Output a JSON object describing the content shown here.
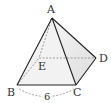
{
  "diagram": {
    "type": "square-based pyramid",
    "vertices": {
      "A": {
        "label": "A",
        "x": 52,
        "y": 18
      },
      "B": {
        "label": "B",
        "x": 17,
        "y": 85
      },
      "C": {
        "label": "C",
        "x": 76,
        "y": 85
      },
      "D": {
        "label": "D",
        "x": 96,
        "y": 58
      },
      "E": {
        "label": "E",
        "x": 39,
        "y": 58
      }
    },
    "measure": {
      "edge": "BC",
      "label": "6"
    },
    "colors": {
      "edge": "#222222",
      "hidden": "#888888",
      "face": "#e8e8e8"
    }
  }
}
